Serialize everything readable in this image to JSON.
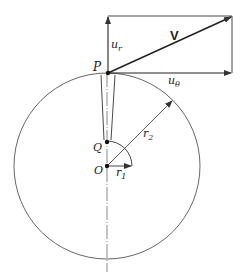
{
  "diagram": {
    "colors": {
      "stroke": "#333333",
      "background": "#ffffff"
    },
    "labels": {
      "velocity": "V",
      "radial_component": "u",
      "radial_sub": "r",
      "tangential_component": "u",
      "tangential_sub": "θ",
      "point_p": "P",
      "point_q": "Q",
      "point_o": "O",
      "radius_1": "r",
      "radius_1_sub": "1",
      "radius_2": "r",
      "radius_2_sub": "2"
    }
  }
}
